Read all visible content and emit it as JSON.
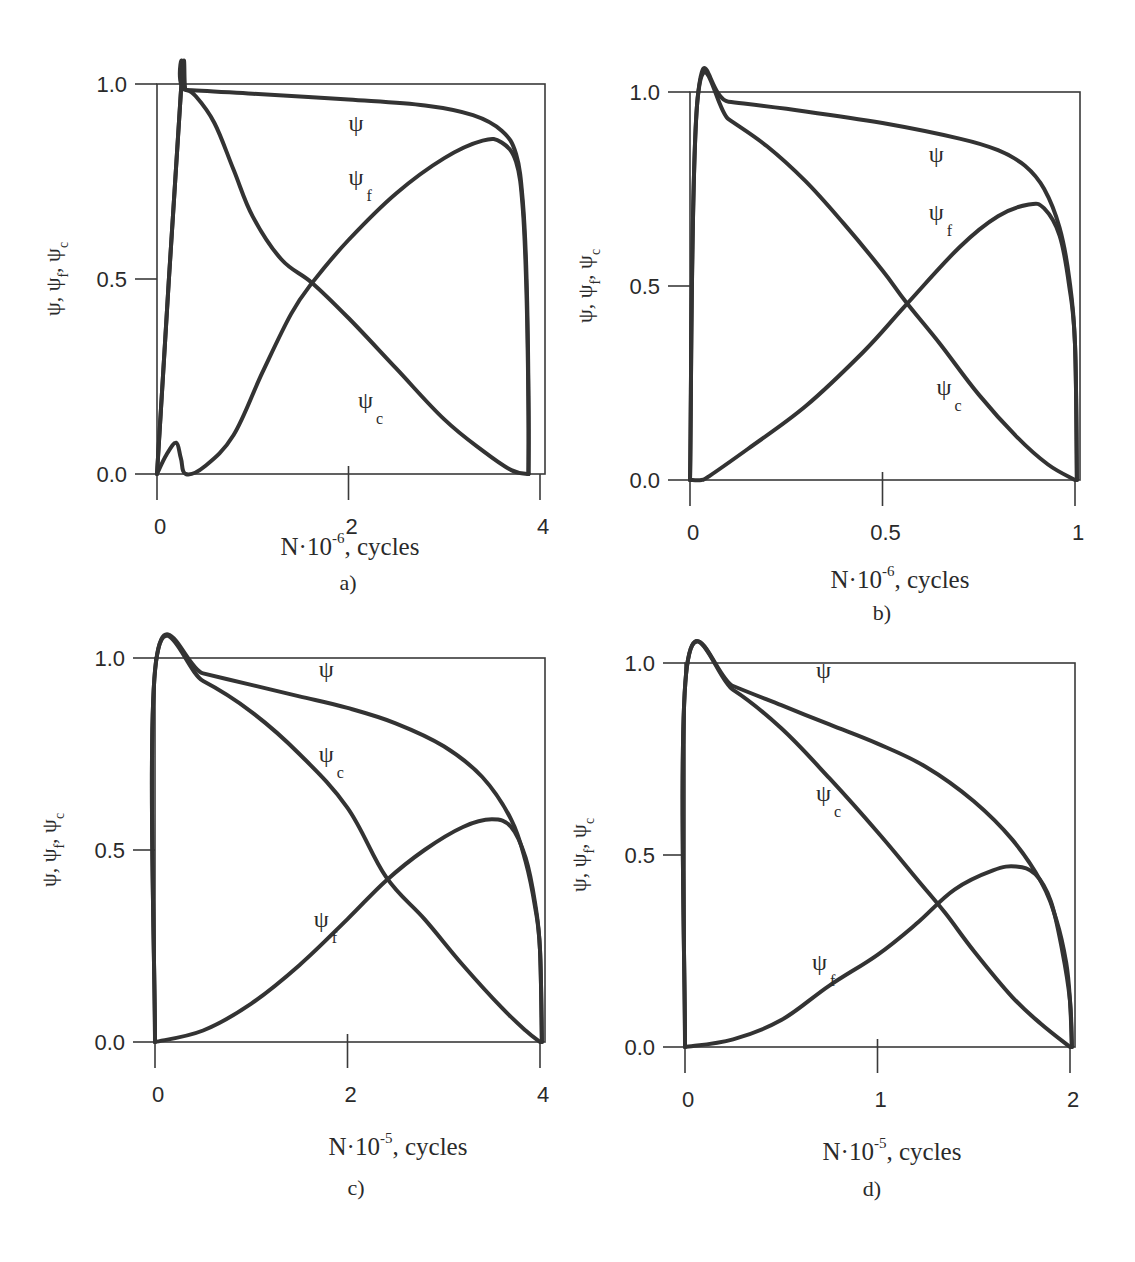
{
  "figure": {
    "ylabel": "ψ, ψf, ψc",
    "ylabel_parts": [
      "ψ, ψ",
      "f",
      ", ψ",
      "c"
    ],
    "curve_names": {
      "psi": "ψ",
      "psi_f_main": "ψ",
      "psi_f_sub": "f",
      "psi_c_main": "ψ",
      "psi_c_sub": "c"
    }
  },
  "chart_data": [
    {
      "id": "a",
      "type": "line",
      "panel_label": "a)",
      "title": "",
      "xlabel": "N·10⁻⁶, cycles",
      "xlabel_main": "N·10",
      "xlabel_exp": "-6",
      "xlabel_tail": ", cycles",
      "ylabel": "ψ, ψf, ψc",
      "xlim": [
        0,
        4
      ],
      "ylim": [
        0,
        1
      ],
      "xticks": [
        0,
        2,
        4
      ],
      "xtick_labels": [
        "0",
        "2",
        "4"
      ],
      "yticks": [
        0,
        0.5,
        1
      ],
      "ytick_labels": [
        "0.0",
        "0.5",
        "1.0"
      ],
      "grid": false,
      "legend": "inline labels",
      "series": [
        {
          "name": "ψ",
          "x": [
            0,
            0.25,
            0.3,
            1.0,
            2.0,
            2.8,
            3.3,
            3.6,
            3.75,
            3.82,
            3.86,
            3.88,
            3.88
          ],
          "y": [
            0,
            0.98,
            0.985,
            0.975,
            0.96,
            0.945,
            0.92,
            0.88,
            0.82,
            0.7,
            0.5,
            0.2,
            0
          ]
        },
        {
          "name": "ψf",
          "x": [
            0,
            0.1,
            0.2,
            0.25,
            0.3,
            0.5,
            0.8,
            1.1,
            1.4,
            1.62,
            2.0,
            2.5,
            3.0,
            3.4,
            3.6,
            3.75,
            3.82,
            3.86,
            3.88,
            3.88
          ],
          "y": [
            0,
            0.05,
            0.08,
            0.04,
            0.0,
            0.02,
            0.1,
            0.26,
            0.41,
            0.49,
            0.6,
            0.72,
            0.81,
            0.855,
            0.85,
            0.8,
            0.68,
            0.45,
            0.15,
            0
          ]
        },
        {
          "name": "ψc",
          "x": [
            0,
            0.25,
            0.3,
            0.4,
            0.6,
            0.8,
            1.0,
            1.3,
            1.62,
            2.0,
            2.5,
            3.0,
            3.4,
            3.7,
            3.88
          ],
          "y": [
            0,
            0.98,
            0.985,
            0.97,
            0.9,
            0.78,
            0.66,
            0.55,
            0.49,
            0.4,
            0.27,
            0.14,
            0.06,
            0.01,
            0
          ]
        }
      ],
      "labels": [
        {
          "text": "ψ",
          "x": 2.0,
          "y": 0.88
        },
        {
          "text": "ψf",
          "x": 2.0,
          "y": 0.74
        },
        {
          "text": "ψc",
          "x": 2.1,
          "y": 0.17
        }
      ]
    },
    {
      "id": "b",
      "type": "line",
      "panel_label": "b)",
      "title": "",
      "xlabel": "N·10⁻⁶, cycles",
      "xlabel_main": "N·10",
      "xlabel_exp": "-6",
      "xlabel_tail": ", cycles",
      "ylabel": "ψ, ψf, ψc",
      "xlim": [
        0,
        1
      ],
      "ylim": [
        0,
        1
      ],
      "xticks": [
        0,
        0.5,
        1
      ],
      "xtick_labels": [
        "0",
        "0.5",
        "1"
      ],
      "yticks": [
        0,
        0.5,
        1
      ],
      "ytick_labels": [
        "0.0",
        "0.5",
        "1.0"
      ],
      "grid": false,
      "legend": "inline labels",
      "series": [
        {
          "name": "ψ",
          "x": [
            0,
            0.02,
            0.1,
            0.3,
            0.5,
            0.7,
            0.8,
            0.87,
            0.92,
            0.96,
            0.985,
            1.0,
            1.005
          ],
          "y": [
            0,
            0.985,
            0.975,
            0.95,
            0.92,
            0.88,
            0.85,
            0.81,
            0.75,
            0.65,
            0.52,
            0.35,
            0
          ]
        },
        {
          "name": "ψf",
          "x": [
            0,
            0.03,
            0.05,
            0.15,
            0.3,
            0.45,
            0.56,
            0.7,
            0.8,
            0.88,
            0.92,
            0.96,
            0.985,
            1.0,
            1.005
          ],
          "y": [
            0,
            0.0,
            0.01,
            0.08,
            0.19,
            0.33,
            0.45,
            0.6,
            0.68,
            0.71,
            0.7,
            0.63,
            0.5,
            0.35,
            0
          ]
        },
        {
          "name": "ψc",
          "x": [
            0,
            0.02,
            0.1,
            0.2,
            0.3,
            0.4,
            0.5,
            0.56,
            0.65,
            0.75,
            0.85,
            0.93,
            1.0
          ],
          "y": [
            0,
            0.985,
            0.93,
            0.86,
            0.77,
            0.66,
            0.54,
            0.46,
            0.35,
            0.22,
            0.11,
            0.04,
            0
          ]
        }
      ],
      "labels": [
        {
          "text": "ψ",
          "x": 0.62,
          "y": 0.82
        },
        {
          "text": "ψf",
          "x": 0.62,
          "y": 0.67
        },
        {
          "text": "ψc",
          "x": 0.64,
          "y": 0.22
        }
      ]
    },
    {
      "id": "c",
      "type": "line",
      "panel_label": "c)",
      "title": "",
      "xlabel": "N·10⁻⁵, cycles",
      "xlabel_main": "N·10",
      "xlabel_exp": "-5",
      "xlabel_tail": ", cycles",
      "ylabel": "ψ, ψf, ψc",
      "xlim": [
        0,
        4
      ],
      "ylim": [
        0,
        1
      ],
      "xticks": [
        0,
        2,
        4
      ],
      "xtick_labels": [
        "0",
        "2",
        "4"
      ],
      "yticks": [
        0,
        0.5,
        1
      ],
      "ytick_labels": [
        "0.0",
        "0.5",
        "1.0"
      ],
      "grid": false,
      "legend": "inline labels",
      "series": [
        {
          "name": "ψ",
          "x": [
            0,
            0.01,
            0.5,
            1.0,
            1.5,
            2.0,
            2.5,
            3.0,
            3.4,
            3.7,
            3.85,
            3.95,
            4.0,
            4.02
          ],
          "y": [
            0,
            0.99,
            0.96,
            0.93,
            0.9,
            0.87,
            0.83,
            0.77,
            0.69,
            0.58,
            0.47,
            0.35,
            0.24,
            0
          ]
        },
        {
          "name": "ψf",
          "x": [
            0,
            0.5,
            1.0,
            1.5,
            2.0,
            2.4,
            2.8,
            3.2,
            3.5,
            3.7,
            3.85,
            3.95,
            4.0,
            4.02
          ],
          "y": [
            0,
            0.03,
            0.1,
            0.2,
            0.32,
            0.42,
            0.5,
            0.56,
            0.58,
            0.56,
            0.48,
            0.36,
            0.24,
            0
          ]
        },
        {
          "name": "ψc",
          "x": [
            0,
            0.01,
            0.5,
            1.0,
            1.5,
            2.0,
            2.4,
            2.8,
            3.2,
            3.6,
            3.85,
            4.0
          ],
          "y": [
            0,
            0.99,
            0.94,
            0.86,
            0.75,
            0.61,
            0.43,
            0.32,
            0.2,
            0.09,
            0.03,
            0
          ]
        }
      ],
      "labels": [
        {
          "text": "ψ",
          "x": 1.7,
          "y": 0.95
        },
        {
          "text": "ψc",
          "x": 1.7,
          "y": 0.73
        },
        {
          "text": "ψf",
          "x": 1.65,
          "y": 0.3
        }
      ]
    },
    {
      "id": "d",
      "type": "line",
      "panel_label": "d)",
      "title": "",
      "xlabel": "N·10⁻⁵, cycles",
      "xlabel_main": "N·10",
      "xlabel_exp": "-5",
      "xlabel_tail": ", cycles",
      "ylabel": "ψ, ψf, ψc",
      "xlim": [
        0,
        2
      ],
      "ylim": [
        0,
        1
      ],
      "xticks": [
        0,
        1,
        2
      ],
      "xtick_labels": [
        "0",
        "1",
        "2"
      ],
      "yticks": [
        0,
        0.5,
        1
      ],
      "ytick_labels": [
        "0.0",
        "0.5",
        "1.0"
      ],
      "grid": false,
      "legend": "inline labels",
      "series": [
        {
          "name": "ψ",
          "x": [
            0,
            0.01,
            0.25,
            0.5,
            0.75,
            1.0,
            1.25,
            1.5,
            1.7,
            1.85,
            1.93,
            1.98,
            2.0,
            2.01
          ],
          "y": [
            0,
            0.99,
            0.94,
            0.89,
            0.84,
            0.79,
            0.73,
            0.64,
            0.54,
            0.43,
            0.33,
            0.22,
            0.12,
            0
          ]
        },
        {
          "name": "ψf",
          "x": [
            0,
            0.25,
            0.5,
            0.75,
            1.0,
            1.2,
            1.4,
            1.6,
            1.72,
            1.82,
            1.9,
            1.96,
            2.0,
            2.01
          ],
          "y": [
            0,
            0.02,
            0.07,
            0.16,
            0.24,
            0.32,
            0.41,
            0.46,
            0.47,
            0.45,
            0.38,
            0.25,
            0.12,
            0
          ]
        },
        {
          "name": "ψc",
          "x": [
            0,
            0.01,
            0.25,
            0.5,
            0.75,
            1.0,
            1.2,
            1.35,
            1.5,
            1.7,
            1.85,
            2.0
          ],
          "y": [
            0,
            0.99,
            0.93,
            0.83,
            0.7,
            0.56,
            0.44,
            0.35,
            0.25,
            0.13,
            0.06,
            0
          ]
        }
      ],
      "labels": [
        {
          "text": "ψ",
          "x": 0.68,
          "y": 0.96
        },
        {
          "text": "ψc",
          "x": 0.68,
          "y": 0.64
        },
        {
          "text": "ψf",
          "x": 0.66,
          "y": 0.2
        }
      ]
    }
  ]
}
